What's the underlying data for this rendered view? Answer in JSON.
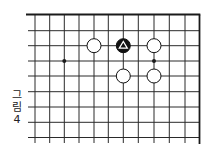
{
  "figure": {
    "caption_chars": [
      "그",
      "림",
      "4"
    ],
    "caption": "그림 4"
  },
  "board": {
    "colors": {
      "line": "#2a2a2a",
      "edge": "#1a1a1a",
      "white_stone_fill": "#ffffff",
      "black_stone_fill": "#111111",
      "marker": "#ffffff"
    },
    "vertical_lines_x": [
      35,
      49.7,
      64.3,
      79,
      94,
      108.3,
      123.3,
      138.3,
      154,
      169.3,
      185
    ],
    "right_edge_x": 199.5,
    "top_edge_y": 14.5,
    "horizontal_lines_y": [
      30.7,
      45.7,
      61,
      76,
      91.7,
      107,
      122.3,
      137.5
    ],
    "horizontal_start_x": 28,
    "vertical_end_y": 143,
    "star_points": [
      {
        "x": 64.3,
        "y": 61
      },
      {
        "x": 154,
        "y": 61
      }
    ],
    "stones": [
      {
        "color": "white",
        "x": 94,
        "y": 45.7
      },
      {
        "color": "black",
        "x": 123.3,
        "y": 45.7,
        "marker": "triangle"
      },
      {
        "color": "white",
        "x": 154,
        "y": 45.7
      },
      {
        "color": "white",
        "x": 123.3,
        "y": 76
      },
      {
        "color": "white",
        "x": 154,
        "y": 76
      }
    ],
    "stone_radius": 7
  }
}
